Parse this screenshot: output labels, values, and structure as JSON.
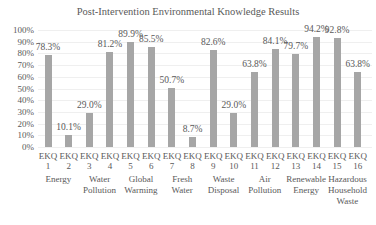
{
  "chart_data": {
    "type": "bar",
    "title": "Post-Intervention Environmental Knowledge Results",
    "xlabel": "",
    "ylabel": "",
    "ylim": [
      0,
      100
    ],
    "yticks": [
      "0%",
      "10%",
      "20%",
      "30%",
      "40%",
      "50%",
      "60%",
      "70%",
      "80%",
      "90%",
      "100%"
    ],
    "grid": true,
    "legend": "none",
    "bar_color": "#a6a6a6",
    "categories": [
      "EKQ 1",
      "EKQ 2",
      "EKQ 3",
      "EKQ 4",
      "EKQ 5",
      "EKQ 6",
      "EKQ 7",
      "EKQ 8",
      "EKQ 9",
      "EKQ 10",
      "EKQ 11",
      "EKQ 12",
      "EKQ 13",
      "EKQ 14",
      "EKQ 15",
      "EKQ 16"
    ],
    "values": [
      78.3,
      10.1,
      29.0,
      81.2,
      89.9,
      85.5,
      50.7,
      8.7,
      82.6,
      29.0,
      63.8,
      84.1,
      79.7,
      94.2,
      92.8,
      63.8
    ],
    "value_labels": [
      "78.3%",
      "10.1%",
      "29.0%",
      "81.2%",
      "89.9%",
      "85.5%",
      "50.7%",
      "8.7%",
      "82.6%",
      "29.0%",
      "63.8%",
      "84.1%",
      "79.7%",
      "94.2%",
      "92.8%",
      "63.8%"
    ],
    "category_groups": [
      {
        "label": "Energy",
        "items": [
          "EKQ 1",
          "EKQ 2"
        ]
      },
      {
        "label": "Water\nPollution",
        "items": [
          "EKQ 3",
          "EKQ 4"
        ]
      },
      {
        "label": "Global\nWarming",
        "items": [
          "EKQ 5",
          "EKQ 6"
        ]
      },
      {
        "label": "Fresh\nWater",
        "items": [
          "EKQ 7",
          "EKQ 8"
        ]
      },
      {
        "label": "Waste\nDisposal",
        "items": [
          "EKQ 9",
          "EKQ 10"
        ]
      },
      {
        "label": "Air\nPollution",
        "items": [
          "EKQ 11",
          "EKQ 12"
        ]
      },
      {
        "label": "Renewable\nEnergy",
        "items": [
          "EKQ 13",
          "EKQ 14"
        ]
      },
      {
        "label": "Hazardous\nHousehold\nWaste",
        "items": [
          "EKQ 15",
          "EKQ 16"
        ]
      }
    ]
  }
}
